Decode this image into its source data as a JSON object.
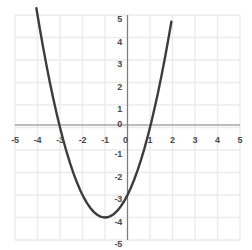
{
  "chart_data": {
    "type": "line",
    "title": "",
    "subtitle": "",
    "xlabel": "",
    "ylabel": "",
    "equation": "y = x^2 + 2x - 3",
    "xlim": [
      -5,
      5
    ],
    "ylim": [
      -5,
      5
    ],
    "grid": true,
    "grid_step": 1,
    "legend": "none",
    "x_tick_labels": [
      "-5",
      "-4",
      "-3",
      "-2",
      "-1",
      "0",
      "1",
      "2",
      "3",
      "4",
      "5"
    ],
    "y_tick_labels": [
      "5",
      "4",
      "3",
      "2",
      "1",
      "0",
      "-1",
      "-2",
      "-3",
      "-4",
      "-5"
    ],
    "x_ticks": [
      -5,
      -4,
      -3,
      -2,
      -1,
      0,
      1,
      2,
      3,
      4,
      5
    ],
    "y_ticks": [
      5,
      4,
      3,
      2,
      1,
      0,
      -1,
      -2,
      -3,
      -4,
      -5
    ],
    "vertex": [
      -1,
      -4
    ],
    "x_intercepts": [
      -3,
      1
    ],
    "y_intercept": -3,
    "series": [
      {
        "name": "y = x^2 + 2x - 3",
        "color": "#3c3c3c",
        "x": [
          -4.05,
          -3.9,
          -3.75,
          -3.6,
          -3.45,
          -3.3,
          -3.15,
          -3.0,
          -2.85,
          -2.7,
          -2.55,
          -2.4,
          -2.25,
          -2.1,
          -1.95,
          -1.8,
          -1.65,
          -1.5,
          -1.35,
          -1.2,
          -1.05,
          -0.9,
          -0.75,
          -0.6,
          -0.45,
          -0.3,
          -0.15,
          0.0,
          0.15,
          0.3,
          0.45,
          0.6,
          0.75,
          0.9,
          1.05,
          1.2,
          1.35,
          1.5,
          1.65,
          1.8,
          1.95,
          2.1
        ],
        "y": [
          5.3,
          4.41,
          3.56,
          2.76,
          2.0,
          1.29,
          0.62,
          0.0,
          -0.58,
          -2.0,
          -2.6,
          -3.16,
          -3.69,
          -3.79,
          -3.9,
          -3.96,
          -3.98,
          -3.75,
          -3.88,
          -3.96,
          -3.9,
          -3.99,
          -3.94,
          -3.84,
          -3.7,
          -3.51,
          -3.28,
          -3.0,
          -2.68,
          -2.31,
          -1.9,
          -1.44,
          -0.94,
          -0.39,
          0.2,
          0.84,
          1.52,
          2.25,
          3.02,
          3.84,
          4.7,
          5.6
        ]
      }
    ],
    "colors": {
      "curve": "#3c3c3c",
      "axis": "#7d7d7d",
      "grid": "#ebebeb",
      "tick_text": "#4a4a4a",
      "background": "#ffffff"
    }
  }
}
